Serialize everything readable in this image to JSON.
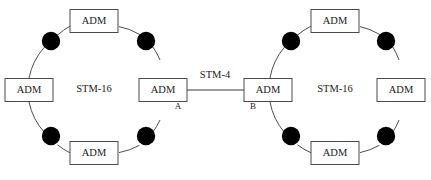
{
  "diagram": {
    "type": "network-topology",
    "stroke_color": "#3a3a3a",
    "background_color": "#ffffff",
    "interconnect": {
      "label": "STM-4",
      "from_node_label": "A",
      "to_node_label": "B",
      "icon_name": "link-line"
    },
    "rings": [
      {
        "id": "left-ring",
        "center_label": "STM-16",
        "center": {
          "x": 94,
          "y": 90
        },
        "radius": 65,
        "nodes": [
          {
            "id": "left-ring-adm-top",
            "label": "ADM",
            "position": "top",
            "x": 94,
            "y": 21,
            "endpoint": ""
          },
          {
            "id": "left-ring-adm-left",
            "label": "ADM",
            "position": "left",
            "x": 29,
            "y": 90,
            "endpoint": ""
          },
          {
            "id": "left-ring-adm-right",
            "label": "ADM",
            "position": "right",
            "x": 163,
            "y": 90,
            "endpoint": "A"
          },
          {
            "id": "left-ring-adm-bottom",
            "label": "ADM",
            "position": "bottom",
            "x": 94,
            "y": 153,
            "endpoint": ""
          }
        ],
        "regenerators": [
          {
            "id": "left-ring-regen-nw",
            "icon_name": "regenerator-icon",
            "x": 51,
            "y": 41,
            "position": "north-west",
            "mirrored": false
          },
          {
            "id": "left-ring-regen-ne",
            "icon_name": "regenerator-icon",
            "x": 146,
            "y": 41,
            "position": "north-east",
            "mirrored": true
          },
          {
            "id": "left-ring-regen-sw",
            "icon_name": "regenerator-icon",
            "x": 51,
            "y": 136,
            "position": "south-west",
            "mirrored": true
          },
          {
            "id": "left-ring-regen-se",
            "icon_name": "regenerator-icon",
            "x": 146,
            "y": 136,
            "position": "south-east",
            "mirrored": false
          }
        ]
      },
      {
        "id": "right-ring",
        "center_label": "STM-16",
        "center": {
          "x": 335,
          "y": 90
        },
        "radius": 65,
        "nodes": [
          {
            "id": "right-ring-adm-top",
            "label": "ADM",
            "position": "top",
            "x": 335,
            "y": 21,
            "endpoint": ""
          },
          {
            "id": "right-ring-adm-left",
            "label": "ADM",
            "position": "left",
            "x": 268,
            "y": 90,
            "endpoint": "B"
          },
          {
            "id": "right-ring-adm-right",
            "label": "ADM",
            "position": "right",
            "x": 401,
            "y": 90,
            "endpoint": ""
          },
          {
            "id": "right-ring-adm-bottom",
            "label": "ADM",
            "position": "bottom",
            "x": 335,
            "y": 153,
            "endpoint": ""
          }
        ],
        "regenerators": [
          {
            "id": "right-ring-regen-nw",
            "icon_name": "regenerator-icon",
            "x": 291,
            "y": 41,
            "position": "north-west",
            "mirrored": false
          },
          {
            "id": "right-ring-regen-ne",
            "icon_name": "regenerator-icon",
            "x": 386,
            "y": 41,
            "position": "north-east",
            "mirrored": true
          },
          {
            "id": "right-ring-regen-sw",
            "icon_name": "regenerator-icon",
            "x": 291,
            "y": 136,
            "position": "south-west",
            "mirrored": true
          },
          {
            "id": "right-ring-regen-se",
            "icon_name": "regenerator-icon",
            "x": 386,
            "y": 136,
            "position": "south-east",
            "mirrored": false
          }
        ]
      }
    ],
    "node_box": {
      "width": 48,
      "height": 23
    },
    "link": {
      "x1": 187,
      "y1": 90,
      "x2": 244,
      "y2": 90,
      "label_x": 215,
      "label_y": 76
    }
  }
}
